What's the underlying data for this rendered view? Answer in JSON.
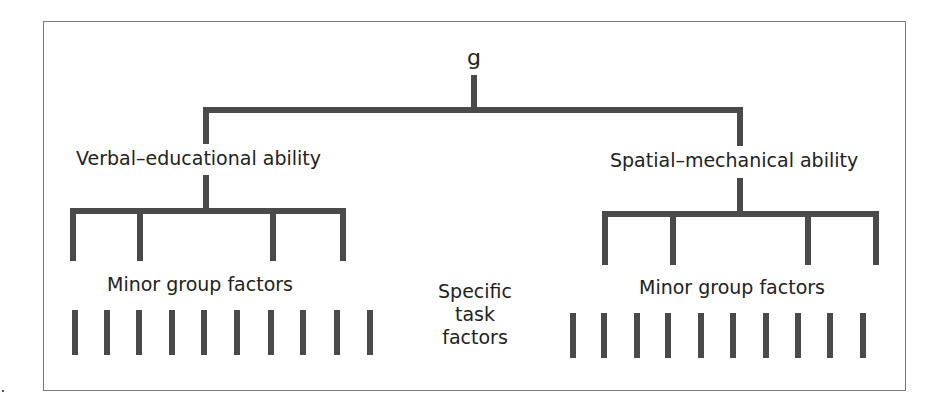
{
  "diagram": {
    "type": "hierarchical-tree",
    "colors": {
      "line": "#4a4a4a",
      "text": "#222222",
      "frame": "#7a7a7a"
    },
    "root": {
      "label": "g"
    },
    "major_group_factors": [
      {
        "label": "Verbal–educational ability",
        "minor_group_factors_count": 4,
        "minor_label": "Minor group factors",
        "specific_task_bars": 10
      },
      {
        "label": "Spatial–mechanical ability",
        "minor_group_factors_count": 4,
        "minor_label": "Minor group factors",
        "specific_task_bars": 10
      }
    ],
    "specific_label": {
      "line1": "Specific",
      "line2": "task",
      "line3": "factors"
    }
  },
  "geometry": {
    "line_width": 6,
    "root_stem": {
      "x": 474,
      "y1": 78,
      "y2": 110
    },
    "top_bar": {
      "y": 110,
      "x1": 206,
      "x2": 740
    },
    "major_stems_up": [
      {
        "x": 206,
        "y1": 110,
        "y2": 141
      },
      {
        "x": 740,
        "y1": 110,
        "y2": 143
      }
    ],
    "major_stems_down": [
      {
        "x": 206,
        "y1": 178,
        "y2": 211
      },
      {
        "x": 740,
        "y1": 181,
        "y2": 214
      }
    ],
    "minor_bars": [
      {
        "y": 211,
        "x1": 73,
        "x2": 343,
        "drops": [
          73,
          140,
          273,
          343
        ],
        "y_end": 258
      },
      {
        "y": 214,
        "x1": 605,
        "x2": 876,
        "drops": [
          605,
          673,
          808,
          876
        ],
        "y_end": 262
      }
    ],
    "task_bars": [
      {
        "xs": [
          75,
          107,
          139,
          172,
          204,
          237,
          271,
          303,
          337,
          370
        ],
        "y1": 310,
        "y2": 355
      },
      {
        "xs": [
          573,
          604,
          637,
          668,
          701,
          733,
          766,
          798,
          830,
          863
        ],
        "y1": 313,
        "y2": 358
      }
    ]
  }
}
